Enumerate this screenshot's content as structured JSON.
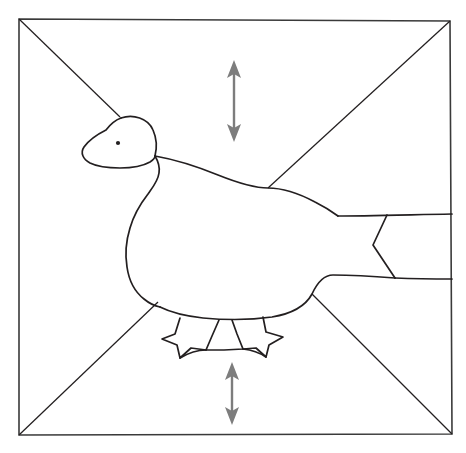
{
  "figure": {
    "canvas": {
      "width": 466,
      "height": 453,
      "background": "#ffffff"
    },
    "colors": {
      "outline": "#231f20",
      "frame": "#3a3a3a",
      "arrow": "#7d7d7d",
      "background": "#ffffff"
    },
    "frame": {
      "name": "square-frame",
      "stroke_width": 1.6,
      "corners": {
        "top_left": [
          19,
          19
        ],
        "top_right": [
          450,
          21
        ],
        "bottom_right": [
          452,
          434
        ],
        "bottom_left": [
          19,
          435
        ]
      }
    },
    "diagonals": [
      {
        "name": "diagonal-top-left",
        "from": [
          19,
          19
        ],
        "to": [
          120,
          117
        ]
      },
      {
        "name": "diagonal-top-right",
        "from": [
          450,
          21
        ],
        "to": [
          268,
          188
        ]
      },
      {
        "name": "diagonal-bottom-left",
        "from": [
          19,
          435
        ],
        "to": [
          158,
          302
        ]
      },
      {
        "name": "diagonal-bottom-right",
        "from": [
          452,
          434
        ],
        "to": [
          312,
          294
        ]
      }
    ],
    "arrows": [
      {
        "name": "arrow-top",
        "orientation": "vertical",
        "double_headed": true,
        "x": 234,
        "y_top": 60,
        "y_bottom": 142,
        "length_px": 82
      },
      {
        "name": "arrow-bottom",
        "orientation": "vertical",
        "double_headed": true,
        "x": 232,
        "y_top": 362,
        "y_bottom": 425,
        "length_px": 63
      }
    ],
    "goose": {
      "name": "goose-outline",
      "eye": {
        "cx": 118,
        "cy": 143,
        "r": 2.1
      },
      "parts": [
        "head",
        "bill",
        "neck",
        "body",
        "back",
        "tail",
        "feet"
      ]
    }
  }
}
